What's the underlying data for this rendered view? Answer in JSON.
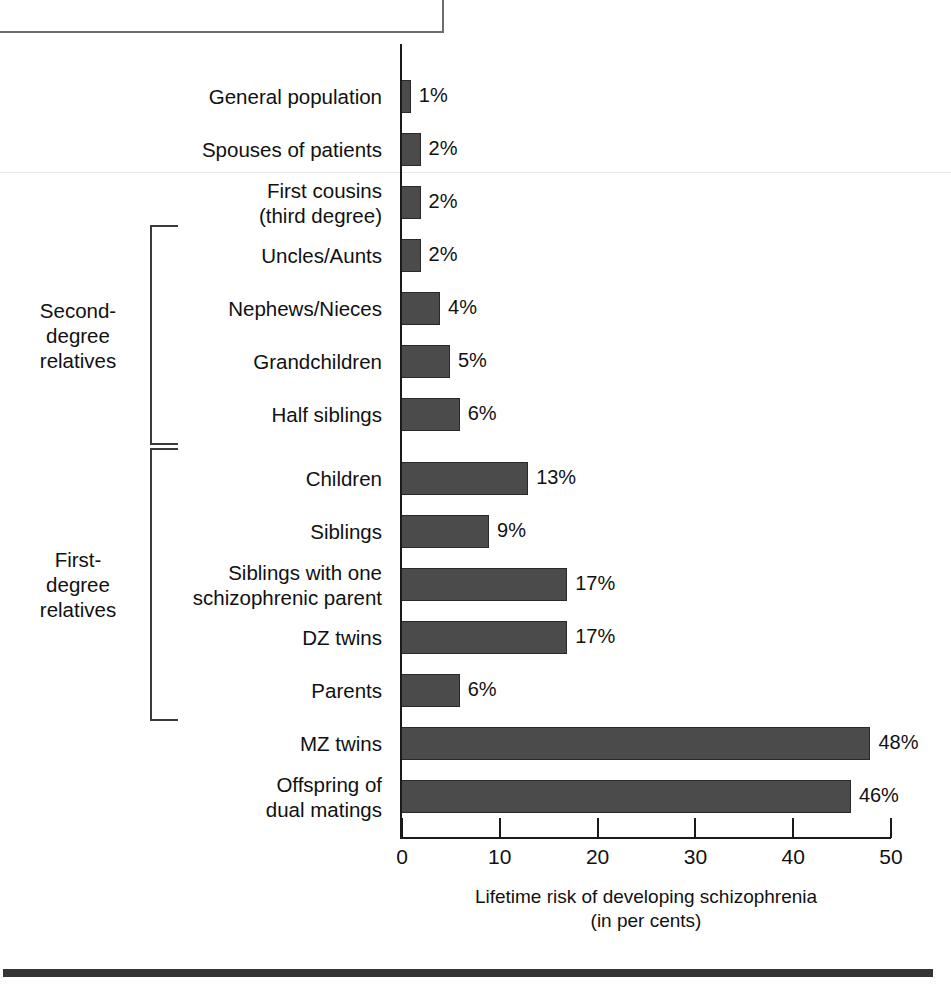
{
  "title": {
    "text": "THE RISK OF DEVELOPING SCHIZOPHRENIA"
  },
  "chart_data": {
    "type": "bar",
    "orientation": "horizontal",
    "title": "THE RISK OF DEVELOPING SCHIZOPHRENIA",
    "xlabel_line1": "Lifetime risk of developing schizophrenia",
    "xlabel_line2": "(in per cents)",
    "ylabel": "",
    "xlim": [
      0,
      50
    ],
    "grid": false,
    "legend": "none",
    "xticks": [
      "0",
      "10",
      "20",
      "30",
      "40",
      "50"
    ],
    "xtick_values": [
      0,
      10,
      20,
      30,
      40,
      50
    ],
    "categories": [
      "General population",
      "Spouses of patients",
      "First cousins (third degree)",
      "Uncles/Aunts",
      "Nephews/Nieces",
      "Grandchildren",
      "Half siblings",
      "Children",
      "Siblings",
      "Siblings with one schizophrenic parent",
      "DZ twins",
      "Parents",
      "MZ twins",
      "Offspring of dual matings"
    ],
    "category_lines": [
      [
        "General population"
      ],
      [
        "Spouses of patients"
      ],
      [
        "First cousins",
        "(third degree)"
      ],
      [
        "Uncles/Aunts"
      ],
      [
        "Nephews/Nieces"
      ],
      [
        "Grandchildren"
      ],
      [
        "Half siblings"
      ],
      [
        "Children"
      ],
      [
        "Siblings"
      ],
      [
        "Siblings with one",
        "schizophrenic parent"
      ],
      [
        "DZ twins"
      ],
      [
        "Parents"
      ],
      [
        "MZ twins"
      ],
      [
        "Offspring of",
        "dual matings"
      ]
    ],
    "values": [
      1,
      2,
      2,
      2,
      4,
      5,
      6,
      13,
      9,
      17,
      17,
      6,
      48,
      46
    ],
    "value_labels": [
      "1%",
      "2%",
      "2%",
      "2%",
      "4%",
      "5%",
      "6%",
      "13%",
      "9%",
      "17%",
      "17%",
      "6%",
      "48%",
      "46%"
    ],
    "bar_color": "#4b4b4b",
    "bar_border_color": "#2a2a2a",
    "axis_color": "#1a1a1a"
  },
  "groups": [
    {
      "id": "second-degree",
      "lines": [
        "Second-",
        "degree",
        "relatives"
      ],
      "first_index": 3,
      "last_index": 6
    },
    {
      "id": "first-degree",
      "lines": [
        "First-",
        "degree",
        "relatives"
      ],
      "first_index": 7,
      "last_index": 11
    }
  ]
}
